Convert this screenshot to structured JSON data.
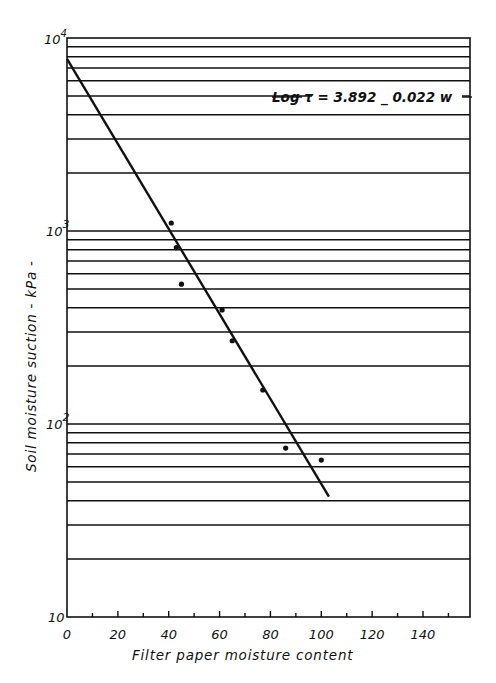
{
  "chart_data": {
    "type": "scatter",
    "title": "",
    "xlabel": "Filter paper moisture content",
    "ylabel": "Soil moisture suction - kPa -",
    "xlim": [
      0,
      158
    ],
    "ylim": [
      10,
      10000
    ],
    "yscale": "log",
    "x_ticks": [
      0,
      20,
      40,
      60,
      80,
      100,
      120,
      140
    ],
    "y_ticks": [
      "10",
      "10^2",
      "10^3",
      "10^4"
    ],
    "grid": "horizontal log gridlines",
    "annotation": "Log τ = 3.892 _ 0.022 w",
    "series": [
      {
        "name": "measured",
        "points": [
          {
            "x": 41,
            "y": 1100
          },
          {
            "x": 43,
            "y": 820
          },
          {
            "x": 45,
            "y": 530
          },
          {
            "x": 61,
            "y": 390
          },
          {
            "x": 65,
            "y": 270
          },
          {
            "x": 77,
            "y": 150
          },
          {
            "x": 86,
            "y": 75
          },
          {
            "x": 100,
            "y": 65
          },
          {
            "x": 100,
            "y": 5300
          }
        ]
      },
      {
        "name": "fit",
        "type": "line",
        "points": [
          {
            "x": 0,
            "y": 7800
          },
          {
            "x": 103,
            "y": 42
          }
        ]
      }
    ]
  },
  "labels": {
    "x_axis": "Filter paper moisture content",
    "y_axis": "Soil moisture suction - kPa -",
    "equation": "Log τ = 3.892 _ 0.022 w",
    "y_tick_10": "10",
    "y_tick_10_2_base": "10",
    "y_tick_10_2_exp": "2",
    "y_tick_10_3_base": "10",
    "y_tick_10_3_exp": "3",
    "y_tick_10_4_base": "10",
    "y_tick_10_4_exp": "4",
    "x_ticks": [
      "0",
      "20",
      "40",
      "60",
      "80",
      "100",
      "120",
      "140"
    ]
  }
}
